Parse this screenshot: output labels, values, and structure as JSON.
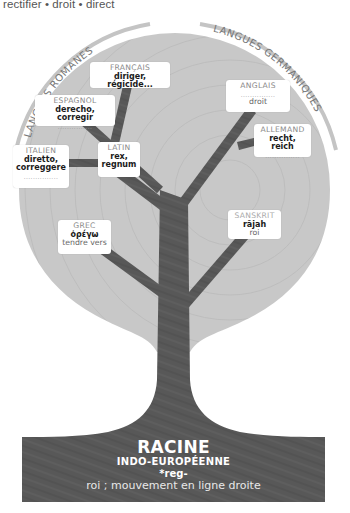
{
  "header": {
    "derived_words": "rectifier • droit • direct"
  },
  "groups": {
    "left": "LANGUES ROMANES",
    "right": "LANGUES GERMANIQUES"
  },
  "languages": [
    {
      "id": "francais",
      "name": "FRANÇAIS",
      "word": "diriger, régicide...",
      "meaning": ""
    },
    {
      "id": "espagnol",
      "name": "ESPAGNOL",
      "word": "derecho, corregir",
      "meaning": "..............."
    },
    {
      "id": "italien",
      "name": "ITALIEN",
      "word": "diretto, correggere",
      "meaning": "..............."
    },
    {
      "id": "latin",
      "name": "LATIN",
      "word": "rex, regnum",
      "meaning": ""
    },
    {
      "id": "grec",
      "name": "GREC",
      "word": "ὀρέγω",
      "meaning": "tendre vers"
    },
    {
      "id": "anglais",
      "name": "ANGLAIS",
      "word": "...............",
      "meaning": "droit"
    },
    {
      "id": "allemand",
      "name": "ALLEMAND",
      "word": "recht, reich",
      "meaning": "..............."
    },
    {
      "id": "sanskrit",
      "name": "SANSKRIT",
      "word": "rājah",
      "meaning": "roi"
    }
  ],
  "root": {
    "title": "RACINE",
    "subtitle": "INDO-EUROPÉENNE",
    "form": "*reg-",
    "meaning": "roi ; mouvement en ligne droite"
  },
  "colors": {
    "canopy": "#c9c9c9",
    "wood": "#5a5a5a",
    "arc": "#bdbdbd",
    "label_gray": "#8a8a8a"
  }
}
